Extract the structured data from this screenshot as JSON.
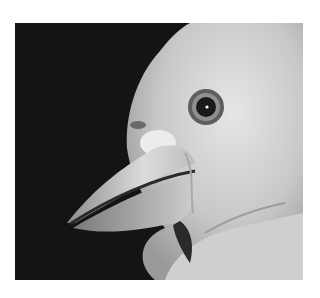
{
  "image": {
    "subject": "close-up grayscale photograph of a bird's head in profile facing left",
    "alt": "Bird head with large eye and open beak against black background",
    "colors": {
      "background": "#141414",
      "page": "#ffffff",
      "plumage_light": "#d8d8d8",
      "plumage_mid": "#b4b4b4",
      "eye_ring": "#8a8a8a",
      "pupil": "#1a1a1a"
    }
  }
}
